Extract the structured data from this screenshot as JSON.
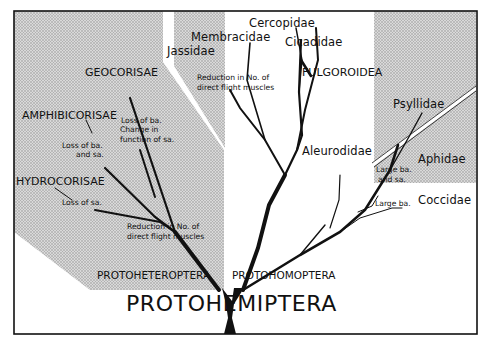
{
  "diagram": {
    "root": "PROTOHEMIPTERA",
    "branches": {
      "left": {
        "name": "PROTOHETEROPTERA",
        "node_note": "Reduction in No. of direct flight muscles",
        "groups": [
          {
            "name": "GEOCORISAE",
            "note": "Loss of ba. Change in function of sa."
          },
          {
            "name": "AMPHIBICORISAE",
            "note": "Loss of ba. and sa."
          },
          {
            "name": "HYDROCORISAE",
            "note": "Loss of sa."
          }
        ]
      },
      "right": {
        "name": "PROTOHOMOPTERA",
        "node_note": "Reduction in No. of direct flight muscles",
        "groups": [
          {
            "name": "Jassidae"
          },
          {
            "name": "Membracidae"
          },
          {
            "name": "Cercopidae"
          },
          {
            "name": "Cicadidae"
          },
          {
            "name": "FULGOROIDEA"
          },
          {
            "name": "Psyllidae"
          },
          {
            "name": "Aleurodidae"
          },
          {
            "name": "Aphidae",
            "note": "Large ba. and sa."
          },
          {
            "name": "Coccidae",
            "note": "Large ba."
          }
        ]
      }
    },
    "labels": {
      "geocorisae": "GEOCORISAE",
      "geocorisae_note1": "Loss of ba.",
      "geocorisae_note2": "Change in",
      "geocorisae_note3": "function of sa.",
      "amphibicorisae": "AMPHIBICORISAE",
      "amphibicorisae_note1": "Loss of ba.",
      "amphibicorisae_note2": "and sa.",
      "hydrocorisae": "HYDROCORISAE",
      "hydrocorisae_note": "Loss of sa.",
      "het_node_note1": "Reduction in No. of",
      "het_node_note2": "direct flight muscles",
      "protoheteroptera": "PROTOHETEROPTERA",
      "protohomoptera": "PROTOHOMOPTERA",
      "protohemiptera": "PROTOHEMIPTERA",
      "jassidae": "Jassidae",
      "membracidae": "Membracidae",
      "cercopidae": "Cercopidae",
      "cicadidae": "Cicadidae",
      "fulgoroidea": "FULGOROIDEA",
      "hom_node_note1": "Reduction in No. of",
      "hom_node_note2": "direct flight muscles",
      "psyllidae": "Psyllidae",
      "aleurodidae": "Aleurodidae",
      "aphidae": "Aphidae",
      "aphidae_note1": "Large ba.",
      "aphidae_note2": "and sa.",
      "coccidae_note": "Large ba.",
      "coccidae": "Coccidae"
    },
    "colors": {
      "shade": "#d2d2d2",
      "ink": "#111111",
      "background": "#ffffff"
    }
  }
}
